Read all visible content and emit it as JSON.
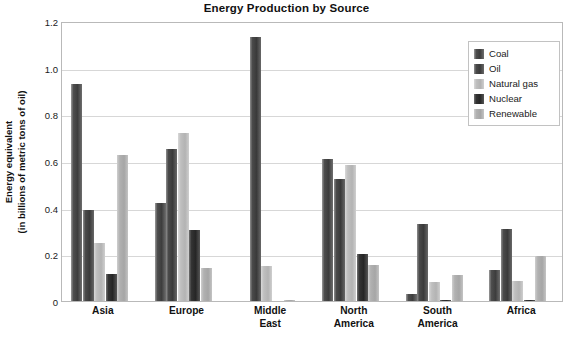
{
  "chart_data": {
    "type": "bar",
    "title": "Energy Production by Source",
    "xlabel": "",
    "ylabel": "Energy equivalent\n(in billions of metric tons of oil)",
    "ylabel_line1": "Energy equivalent",
    "ylabel_line2": "(in billions of metric tons of oil)",
    "ylim": [
      0,
      1.2
    ],
    "ytick_labels": [
      "1.2",
      "1.0",
      "0.8",
      "0.6",
      "0.4",
      "0.2",
      "0"
    ],
    "ytick_values": [
      1.2,
      1.0,
      0.8,
      0.6,
      0.4,
      0.2,
      0
    ],
    "grid": true,
    "grid_axis": "y",
    "legend_position": "top-right-inside",
    "categories": [
      "Asia",
      "Europe",
      "Middle East",
      "North America",
      "South America",
      "Africa"
    ],
    "category_lines": [
      [
        "Asia"
      ],
      [
        "Europe"
      ],
      [
        "Middle",
        "East"
      ],
      [
        "North",
        "America"
      ],
      [
        "South",
        "America"
      ],
      [
        "Africa"
      ]
    ],
    "series": [
      {
        "name": "Coal",
        "key": "coal",
        "color": "#474747",
        "values": [
          0.93,
          0.42,
          0.0,
          0.61,
          0.03,
          0.135
        ]
      },
      {
        "name": "Oil",
        "key": "oil",
        "color": "#444444",
        "values": [
          0.39,
          0.65,
          1.13,
          0.525,
          0.33,
          0.31
        ]
      },
      {
        "name": "Natural gas",
        "key": "gas",
        "color": "#bdbdbd",
        "values": [
          0.25,
          0.72,
          0.15,
          0.585,
          0.08,
          0.085
        ]
      },
      {
        "name": "Nuclear",
        "key": "nuclear",
        "color": "#2e2e2e",
        "values": [
          0.115,
          0.305,
          0.0,
          0.2,
          0.005,
          0.005
        ]
      },
      {
        "name": "Renewable",
        "key": "renew",
        "color": "#b2b2b2",
        "values": [
          0.625,
          0.14,
          0.005,
          0.155,
          0.11,
          0.195
        ]
      }
    ]
  },
  "legend": {
    "items": [
      {
        "label": "Coal",
        "key": "coal"
      },
      {
        "label": "Oil",
        "key": "oil"
      },
      {
        "label": "Natural gas",
        "key": "gas"
      },
      {
        "label": "Nuclear",
        "key": "nuclear"
      },
      {
        "label": "Renewable",
        "key": "renew"
      }
    ]
  }
}
